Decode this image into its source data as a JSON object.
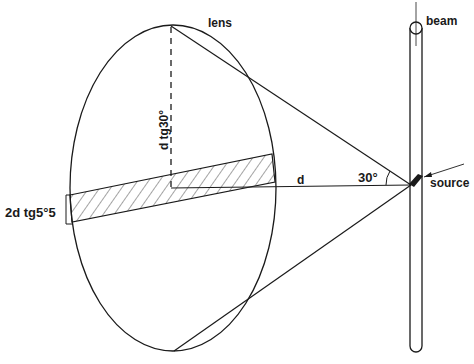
{
  "diagram": {
    "type": "optics-geometry",
    "labels": {
      "lens": "lens",
      "beam": "beam",
      "source": "source",
      "distance": "d",
      "angle": "30°",
      "half_height": "d tg30°",
      "band_width": "2d  tg5°5"
    },
    "colors": {
      "stroke": "#1a1a1a",
      "background": "#ffffff"
    },
    "geometry": {
      "lens_ellipse": {
        "cx": 173,
        "cy": 188,
        "rx": 103,
        "ry": 163
      },
      "source_point": {
        "x": 411,
        "y": 185
      },
      "lens_top": {
        "x": 171,
        "y": 26
      },
      "lens_bottom": {
        "x": 174,
        "y": 351
      },
      "cone_half_angle_deg": 30,
      "hatched_band_half_angle_deg": 5.5
    }
  }
}
